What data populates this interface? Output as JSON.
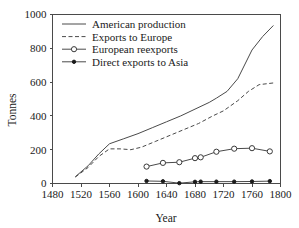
{
  "chart_data": {
    "type": "line",
    "title": "",
    "xlabel": "Year",
    "ylabel": "Tonnes",
    "xlim": [
      1480,
      1800
    ],
    "ylim": [
      0,
      1000
    ],
    "xticks": [
      1480,
      1520,
      1560,
      1600,
      1640,
      1680,
      1720,
      1760,
      1800
    ],
    "yticks": [
      0,
      200,
      400,
      600,
      800,
      1000
    ],
    "grid": false,
    "legend_position": "top-left",
    "series": [
      {
        "name": "American production",
        "style": "solid",
        "marker": "none",
        "color": "#4a4a4a",
        "x": [
          1512,
          1530,
          1545,
          1560,
          1580,
          1600,
          1620,
          1640,
          1660,
          1680,
          1700,
          1710,
          1725,
          1740,
          1760,
          1775,
          1790
        ],
        "values": [
          40,
          105,
          175,
          235,
          265,
          295,
          330,
          365,
          400,
          440,
          480,
          505,
          545,
          620,
          790,
          870,
          935
        ]
      },
      {
        "name": "Exports to Europe",
        "style": "dashed",
        "marker": "none",
        "color": "#4a4a4a",
        "x": [
          1512,
          1530,
          1545,
          1560,
          1575,
          1590,
          1605,
          1625,
          1645,
          1665,
          1685,
          1705,
          1720,
          1740,
          1755,
          1770,
          1790
        ],
        "values": [
          38,
          95,
          160,
          205,
          205,
          200,
          215,
          250,
          285,
          320,
          355,
          400,
          430,
          490,
          545,
          585,
          595
        ]
      },
      {
        "name": "European reexports",
        "style": "solid",
        "marker": "open-circle",
        "color": "#4a4a4a",
        "x": [
          1612,
          1635,
          1658,
          1680,
          1688,
          1710,
          1735,
          1760,
          1785
        ],
        "values": [
          100,
          122,
          126,
          150,
          155,
          188,
          206,
          209,
          190
        ]
      },
      {
        "name": "Direct exports to Asia",
        "style": "solid",
        "marker": "filled-circle",
        "color": "#1a1a1a",
        "x": [
          1612,
          1635,
          1658,
          1680,
          1688,
          1710,
          1735,
          1760,
          1785
        ],
        "values": [
          15,
          13,
          2,
          10,
          11,
          11,
          11,
          12,
          14
        ]
      }
    ],
    "legend_entries": [
      {
        "label": "American production",
        "style": "solid",
        "marker": "none"
      },
      {
        "label": "Exports to Europe",
        "style": "dashed",
        "marker": "none"
      },
      {
        "label": "European reexports",
        "style": "solid",
        "marker": "open-circle"
      },
      {
        "label": "Direct exports to Asia",
        "style": "solid",
        "marker": "filled-circle"
      }
    ]
  }
}
